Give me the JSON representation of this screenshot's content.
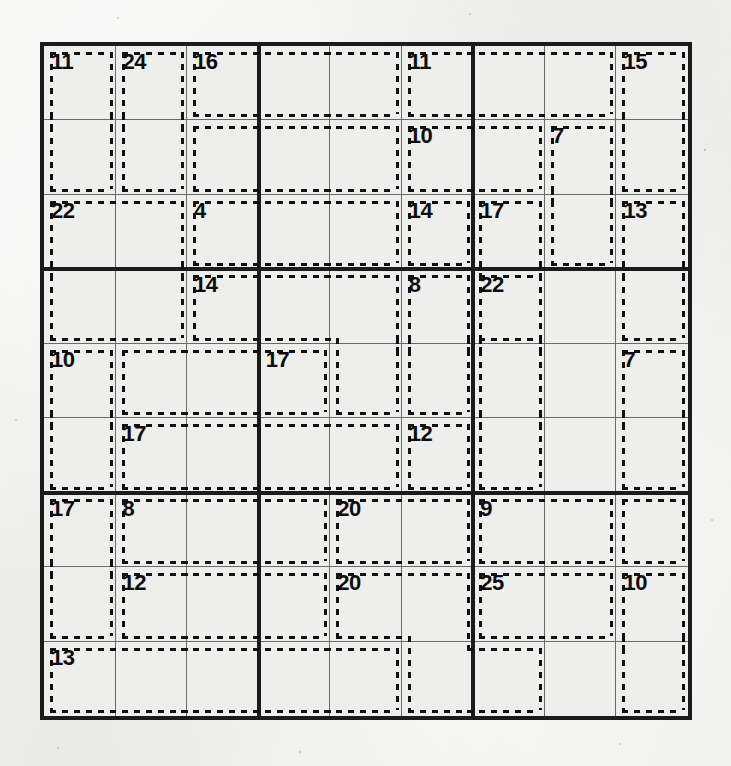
{
  "puzzle": {
    "type": "killer-sudoku",
    "grid_size": 9,
    "box_size": 3,
    "given_digits": [],
    "colors": {
      "paper": "#ececea",
      "cell_bg": "#eeeeec",
      "thin_line": "#6a6a68",
      "thick_line": "#1b1b1b",
      "cage_dash": "#111111",
      "sum_text": "#0d0d0d"
    },
    "board_px": {
      "left": 40,
      "top": 42,
      "width": 652,
      "height": 678,
      "cell": 72.4
    },
    "cages": [
      {
        "sum": "11",
        "label_cell": "r1c1",
        "cells": [
          "r1c1",
          "r2c1"
        ]
      },
      {
        "sum": "24",
        "label_cell": "r1c2",
        "cells": [
          "r1c2",
          "r2c2"
        ]
      },
      {
        "sum": "16",
        "label_cell": "r1c3",
        "cells": [
          "r1c3",
          "r1c4",
          "r1c5"
        ]
      },
      {
        "sum": "11",
        "label_cell": "r1c6",
        "cells": [
          "r1c6",
          "r1c7",
          "r1c8"
        ]
      },
      {
        "sum": "15",
        "label_cell": "r1c9",
        "cells": [
          "r1c9",
          "r2c9"
        ]
      },
      {
        "sum": "22",
        "label_cell": "r3c1",
        "cells": [
          "r2c3",
          "r2c4",
          "r2c5",
          "r3c1",
          "r3c2",
          "r4c1",
          "r4c2"
        ]
      },
      {
        "sum": "10",
        "label_cell": "r2c6",
        "cells": [
          "r2c6",
          "r2c7"
        ]
      },
      {
        "sum": "7",
        "label_cell": "r2c8",
        "cells": [
          "r2c8",
          "r3c8"
        ]
      },
      {
        "sum": "4",
        "label_cell": "r3c3",
        "cells": [
          "r3c3",
          "r3c4",
          "r3c5"
        ]
      },
      {
        "sum": "14",
        "label_cell": "r3c6",
        "cells": [
          "r3c6"
        ]
      },
      {
        "sum": "17",
        "label_cell": "r3c7",
        "cells": [
          "r3c7",
          "r4c7"
        ]
      },
      {
        "sum": "13",
        "label_cell": "r3c9",
        "cells": [
          "r3c9",
          "r4c9"
        ]
      },
      {
        "sum": "14",
        "label_cell": "r4c3",
        "cells": [
          "r4c3",
          "r4c4",
          "r4c5",
          "r5c5"
        ]
      },
      {
        "sum": "8",
        "label_cell": "r4c6",
        "cells": [
          "r4c6",
          "r5c6"
        ]
      },
      {
        "sum": "22",
        "label_cell": "r4c7",
        "cells": [
          "r4c7",
          "r5c7",
          "r6c7"
        ]
      },
      {
        "sum": "10",
        "label_cell": "r5c1",
        "cells": [
          "r5c1",
          "r6c1"
        ]
      },
      {
        "sum": "17",
        "label_cell": "r5c4",
        "cells": [
          "r5c2",
          "r5c3",
          "r5c4"
        ]
      },
      {
        "sum": "7",
        "label_cell": "r5c9",
        "cells": [
          "r5c9",
          "r6c9"
        ]
      },
      {
        "sum": "17",
        "label_cell": "r6c2",
        "cells": [
          "r6c2",
          "r6c3",
          "r6c4",
          "r6c5"
        ]
      },
      {
        "sum": "12",
        "label_cell": "r6c6",
        "cells": [
          "r6c6"
        ]
      },
      {
        "sum": "17",
        "label_cell": "r7c1",
        "cells": [
          "r7c1",
          "r8c1"
        ]
      },
      {
        "sum": "8",
        "label_cell": "r7c2",
        "cells": [
          "r7c2",
          "r7c3",
          "r7c4"
        ]
      },
      {
        "sum": "20",
        "label_cell": "r7c5",
        "cells": [
          "r7c5",
          "r7c6"
        ]
      },
      {
        "sum": "9",
        "label_cell": "r7c7",
        "cells": [
          "r7c7",
          "r7c8"
        ]
      },
      {
        "sum": "12",
        "label_cell": "r8c2",
        "cells": [
          "r8c2",
          "r8c3",
          "r8c4"
        ]
      },
      {
        "sum": "20",
        "label_cell": "r8c5",
        "cells": [
          "r8c5",
          "r8c6",
          "r9c6",
          "r9c7"
        ]
      },
      {
        "sum": "25",
        "label_cell": "r8c7",
        "cells": [
          "r8c7",
          "r8c8"
        ]
      },
      {
        "sum": "10",
        "label_cell": "r8c9",
        "cells": [
          "r8c9",
          "r9c9"
        ]
      },
      {
        "sum": "13",
        "label_cell": "r9c1",
        "cells": [
          "r9c1",
          "r9c2",
          "r9c3",
          "r9c4",
          "r9c5"
        ]
      },
      {
        "sum": "7b",
        "label_cell": "",
        "cells": [
          "r7c9"
        ]
      }
    ],
    "cage_sums_in_reading_order": [
      "11",
      "24",
      "16",
      "11",
      "15",
      "10",
      "7",
      "22",
      "4",
      "14",
      "17",
      "13",
      "14",
      "8",
      "22",
      "10",
      "17",
      "7",
      "17",
      "12",
      "17",
      "8",
      "20",
      "9",
      "12",
      "20",
      "25",
      "10",
      "13"
    ]
  }
}
